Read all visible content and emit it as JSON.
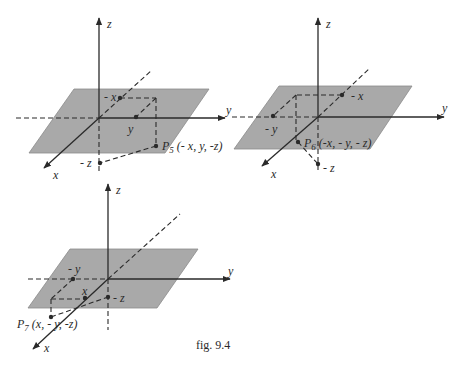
{
  "figure": {
    "caption": "fig. 9.4",
    "colors": {
      "plane": "#a9a9a9",
      "ink": "#2a2a2a",
      "background": "#ffffff"
    }
  },
  "diagrams": [
    {
      "id": "octant-5",
      "axis_labels": {
        "x": "x",
        "y": "y",
        "z": "z"
      },
      "point_labels": {
        "neg_x": "- x",
        "pos_y": "y",
        "neg_z": "- z"
      },
      "point": {
        "name": "P",
        "subscript": "5",
        "coords": "(- x, y, -z)"
      }
    },
    {
      "id": "octant-6",
      "axis_labels": {
        "x": "x",
        "y": "y",
        "z": "z"
      },
      "point_labels": {
        "neg_x": "- x",
        "neg_y": "- y",
        "neg_z": "- z"
      },
      "point": {
        "name": "P",
        "subscript": "6",
        "coords": "(-x, - y, - z)"
      }
    },
    {
      "id": "octant-7",
      "axis_labels": {
        "x": "x",
        "y": "y",
        "z": "z"
      },
      "point_labels": {
        "pos_x": "x",
        "neg_y": "- y",
        "neg_z": "- z"
      },
      "point": {
        "name": "P",
        "subscript": "7",
        "coords": "(x, - y, -z)"
      }
    }
  ]
}
